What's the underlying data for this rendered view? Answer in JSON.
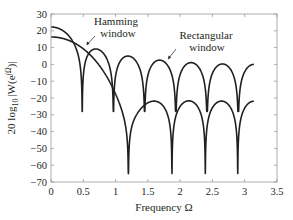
{
  "chart_data": {
    "type": "line",
    "title": "",
    "xlabel": "Frequency Ω",
    "ylabel": "20 log10|W(e^jΩ)|",
    "ylabel_parts": {
      "prefix": "20 log",
      "sub": "10",
      "mid": "|W(e",
      "sup": "jΩ",
      "suffix": ")|"
    },
    "xlim": [
      0,
      3.5
    ],
    "ylim": [
      -70,
      30
    ],
    "xticks": [
      0,
      0.5,
      1,
      1.5,
      2,
      2.5,
      3,
      3.5
    ],
    "xtick_labels": [
      "0",
      "0.5",
      "1",
      "1.5",
      "2",
      "2.5",
      "3",
      "3.5"
    ],
    "yticks": [
      30,
      20,
      10,
      0,
      -10,
      -20,
      -30,
      -40,
      -50,
      -60,
      -70
    ],
    "ytick_labels": [
      "30",
      "20",
      "10",
      "0",
      "−10",
      "−20",
      "−30",
      "−40",
      "−50",
      "−60",
      "−70"
    ],
    "grid": false,
    "legend": "none (annotations)",
    "x_range_plotted": [
      0,
      3.1416
    ],
    "series": [
      {
        "name": "Rectangular window",
        "window": "rectangular",
        "N": 13,
        "peak_db": 22.3,
        "nulls": [
          0.483,
          0.967,
          1.45,
          1.933,
          2.417,
          2.9
        ],
        "sidelobe_peaks": [
          [
            0.72,
            9.0
          ],
          [
            1.21,
            5.0
          ],
          [
            1.69,
            3.2
          ],
          [
            2.18,
            2.0
          ],
          [
            2.66,
            1.0
          ],
          [
            3.14,
            0.0
          ]
        ],
        "end_value_db": 0.0,
        "null_floor_db": -28
      },
      {
        "name": "Hamming window",
        "window": "hamming",
        "N": 13,
        "peak_db": 16.7,
        "nulls": [
          1.2,
          1.87,
          2.41,
          2.9
        ],
        "sidelobe_peaks": [
          [
            1.52,
            -21.5
          ],
          [
            2.15,
            -21.0
          ],
          [
            2.66,
            -21.5
          ],
          [
            3.14,
            -22.0
          ]
        ],
        "end_value_db": -22.0,
        "null_floor_db": -65
      }
    ],
    "annotations": [
      {
        "text_lines": [
          "Hamming",
          "window"
        ],
        "target_series": "Hamming window"
      },
      {
        "text_lines": [
          "Rectangular",
          "window"
        ],
        "target_series": "Rectangular window"
      }
    ]
  }
}
